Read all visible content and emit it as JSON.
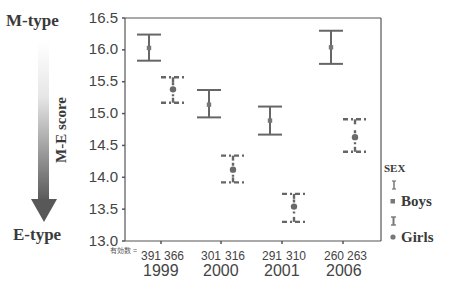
{
  "chart_data": {
    "type": "errorbar",
    "title": "",
    "xlabel": "",
    "ylabel": "M-E score",
    "ylim": [
      13.0,
      16.5
    ],
    "yticks": [
      "16.5",
      "16.0",
      "15.5",
      "15.0",
      "14.5",
      "14.0",
      "13.5",
      "13.0"
    ],
    "categories": [
      "1999",
      "2000",
      "2001",
      "2006"
    ],
    "count_label": "有効数 =",
    "counts": [
      {
        "boys": "391",
        "girls": "366"
      },
      {
        "boys": "301",
        "girls": "316"
      },
      {
        "boys": "291",
        "girls": "310"
      },
      {
        "boys": "260",
        "girls": "263"
      }
    ],
    "legend": {
      "title": "SEX",
      "position": "right",
      "entries": [
        "Boys",
        "Girls"
      ]
    },
    "series": [
      {
        "name": "Boys",
        "style": "solid",
        "marker": "square",
        "means": [
          16.03,
          15.14,
          14.89,
          16.04
        ],
        "upper": [
          16.24,
          15.37,
          15.11,
          16.3
        ],
        "lower": [
          15.83,
          14.94,
          14.67,
          15.78
        ]
      },
      {
        "name": "Girls",
        "style": "dashed",
        "marker": "circle",
        "means": [
          15.38,
          14.12,
          13.54,
          14.63
        ],
        "upper": [
          15.57,
          14.34,
          13.74,
          14.91
        ],
        "lower": [
          15.17,
          13.92,
          13.3,
          14.4
        ]
      }
    ],
    "grid": false,
    "annotations": {
      "top": "M-type",
      "bottom": "E-type",
      "arrow": "gradient arrow pointing down from M-type to E-type"
    }
  },
  "colors": {
    "bars": "#666666",
    "axis": "#555555",
    "arrow_dark": "#555555"
  }
}
